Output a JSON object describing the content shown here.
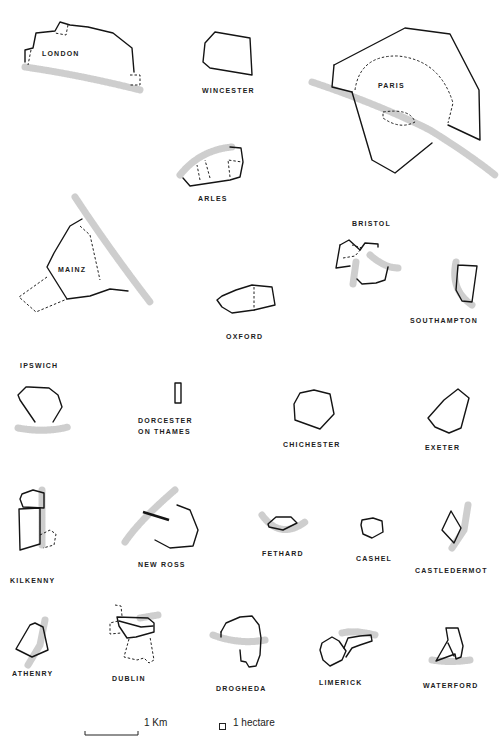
{
  "figure": {
    "towns": [
      {
        "id": "london",
        "name": "LONDON",
        "label_x": 42,
        "label_y": 55,
        "walls": [
          "M25,62 L25,50 L33,48 L36,33 L55,31 L60,22 L70,25 L88,27 L113,33 L132,48 L134,72"
        ],
        "old": [
          "M68,25 L66,35 L55,33",
          "M31,50 L28,65",
          "M130,75 L140,75 L140,85 L130,85"
        ],
        "river": [
          "M25,67 Q80,75 140,90"
        ]
      },
      {
        "id": "wincester",
        "name": "WINCESTER",
        "label_x": 202,
        "label_y": 92,
        "walls": [
          "M215,32 L250,38 L252,75 L210,68 L203,62 L205,43 Z"
        ],
        "old": [],
        "river": []
      },
      {
        "id": "paris",
        "name": "PARIS",
        "label_x": 378,
        "label_y": 87,
        "walls": [
          "M334,65 L405,28 L450,34 L479,90 L480,140 L448,125",
          "M352,92 L372,160 L395,173 L432,143",
          "M334,65 L332,87 L352,92"
        ],
        "old": [
          "M355,90 Q360,55 398,56 Q440,60 453,103 L448,123",
          "M383,112 Q410,108 415,122 Q400,130 383,118 Z"
        ],
        "river": [
          "M312,82 Q380,105 430,130 Q470,155 495,175"
        ]
      },
      {
        "id": "arles",
        "name": "ARLES",
        "label_x": 198,
        "label_y": 200,
        "walls": [
          "M183,178 L190,186 L230,180 L240,177 L243,162 L241,148 L230,147"
        ],
        "old": [
          "M200,180 L197,165",
          "M210,178 L205,160",
          "M230,177 L228,160 L242,162"
        ],
        "river": [
          "M180,175 Q200,150 232,147"
        ]
      },
      {
        "id": "mainz",
        "name": "MAINZ",
        "label_x": 58,
        "label_y": 271,
        "walls": [
          "M82,219 L70,226 L54,253 L47,267 L67,299 L90,296 L110,289 L128,291"
        ],
        "old": [
          "M80,226 L90,235 L100,280",
          "M47,277 L19,297 L36,312 L67,299"
        ],
        "river": [
          "M75,197 Q110,250 150,302"
        ]
      },
      {
        "id": "oxford",
        "name": "OXFORD",
        "label_x": 226,
        "label_y": 338,
        "walls": [
          "M222,296 L236,290 L252,285 L272,287 L275,305 L254,310 L232,313 L222,307 L217,300 Z"
        ],
        "old": [
          "M254,287 L254,311"
        ],
        "river": []
      },
      {
        "id": "bristol",
        "name": "BRISTOL",
        "label_x": 352,
        "label_y": 225,
        "walls": [
          "M340,245 L349,240 L360,250 L365,243 L378,244 L378,247",
          "M340,245 L336,268 L350,266",
          "M357,279 L362,284 L376,283 L385,280 L388,267"
        ],
        "old": [
          "M343,258 L355,256 L362,248 L352,245"
        ],
        "river": [
          "M370,255 Q385,268 398,268",
          "M356,262 L353,284"
        ]
      },
      {
        "id": "southampton",
        "name": "SOUTHAMPTON",
        "label_x": 410,
        "label_y": 322,
        "walls": [
          "M458,265 L477,266 L472,302 L462,301 L456,290 L458,265"
        ],
        "old": [],
        "river": [
          "M456,262 Q450,290 472,305"
        ]
      },
      {
        "id": "ipswich",
        "name": "IPSWICH",
        "label_x": 20,
        "label_y": 367,
        "walls": [
          "M35,422 L20,400 L18,395 L26,387 L29,387 L49,388 L58,395 L62,407 L53,422"
        ],
        "old": [],
        "river": [
          "M18,428 Q45,433 68,427"
        ]
      },
      {
        "id": "dorcester",
        "name": "DORCESTER",
        "name2": "ON THAMES",
        "label_x": 138,
        "label_y": 422,
        "walls": [
          "M175,383 L181,383 L181,403 L175,403 Z"
        ],
        "old": [],
        "river": []
      },
      {
        "id": "chichester",
        "name": "CHICHESTER",
        "label_x": 283,
        "label_y": 446,
        "walls": [
          "M300,393 L314,390 L330,394 L334,414 L320,429 L295,420 L294,404 Z"
        ],
        "old": [],
        "river": []
      },
      {
        "id": "exeter",
        "name": "EXETER",
        "label_x": 425,
        "label_y": 449,
        "walls": [
          "M458,389 L469,398 L461,428 L449,433 L435,427 L428,418 L444,400 Z"
        ],
        "old": [],
        "river": []
      },
      {
        "id": "kilkenny",
        "name": "KILKENNY",
        "label_x": 10,
        "label_y": 582,
        "walls": [
          "M22,494 L33,490 L44,493 L44,508 L23,507 L20,499 Z",
          "M19,509 L40,508 L40,544 L20,550 Z"
        ],
        "old": [
          "M40,535 L50,530 L56,534 L54,545 L43,548"
        ],
        "river": [
          "M42,490 L42,545"
        ]
      },
      {
        "id": "newross",
        "name": "NEW ROSS",
        "label_x": 138,
        "label_y": 566,
        "walls": [
          "M155,540 L170,548 L193,546 L198,530 L190,510 L177,505"
        ],
        "old": [],
        "river": [
          "M175,490 Q140,520 125,542"
        ],
        "bridge": "M143,512 L169,520"
      },
      {
        "id": "fethard",
        "name": "FETHARD",
        "label_x": 262,
        "label_y": 555,
        "walls": [
          "M268,524 L276,517 L291,517 L297,523 L283,530 L269,527 Z"
        ],
        "old": [],
        "river": [
          "M262,515 Q280,540 305,522"
        ]
      },
      {
        "id": "cashel",
        "name": "CASHEL",
        "label_x": 356,
        "label_y": 560,
        "walls": [
          "M362,520 L373,518 L382,521 L383,532 L372,538 L363,534 L361,525 Z"
        ],
        "old": [],
        "river": []
      },
      {
        "id": "castledermot",
        "name": "CASTLEDERMOT",
        "label_x": 415,
        "label_y": 572,
        "walls": [
          "M451,511 L461,528 L454,543 L442,530 Z"
        ],
        "old": [],
        "river": [
          "M468,505 L464,530 L452,548"
        ]
      },
      {
        "id": "athenry",
        "name": "ATHENRY",
        "label_x": 12,
        "label_y": 675,
        "walls": [
          "M30,625 L35,623 L43,627 L48,650 L32,657 L16,649 Z"
        ],
        "old": [],
        "river": [
          "M45,620 L40,645 L28,665"
        ]
      },
      {
        "id": "dublin",
        "name": "DUBLIN",
        "label_x": 112,
        "label_y": 680,
        "walls": [
          "M117,617 L148,618 L154,623 L154,632 L136,637 L127,638 L119,626 Z",
          "M119,621 L141,627 L153,626"
        ],
        "old": [
          "M115,605 L121,606 L122,616",
          "M118,621 L110,623 L110,634 L121,633",
          "M129,639 L124,657 L137,660 L144,658 L149,663 L154,660 L150,637"
        ],
        "river": [
          "M140,618 L158,615"
        ]
      },
      {
        "id": "drogheda",
        "name": "DROGHEDA",
        "label_x": 216,
        "label_y": 690,
        "walls": [
          "M221,632 L226,623 L240,617 L252,616 L259,625 L261,638 L260,655 L256,666 L249,667 L246,662 L241,661 L240,650",
          "M221,632 L221,637"
        ],
        "old": [],
        "river": [
          "M213,635 Q240,645 265,640"
        ]
      },
      {
        "id": "limerick",
        "name": "LIMERICK",
        "label_x": 319,
        "label_y": 684,
        "walls": [
          "M322,643 L332,637 L339,641 L346,651 L342,660 L330,666 L323,660 L320,650 Z",
          "M344,648 L348,638 L360,636 L371,635 L372,641 L360,645 L352,648 L346,657"
        ],
        "old": [],
        "river": [
          "M342,633 Q355,630 375,635"
        ]
      },
      {
        "id": "waterford",
        "name": "WATERFORD",
        "label_x": 423,
        "label_y": 687,
        "walls": [
          "M446,628 L458,628 L463,646 L461,657 L456,659 L455,654 L436,661 L448,640 L446,628",
          "M448,643 L454,656"
        ],
        "old": [],
        "river": [
          "M432,660 Q450,663 470,660"
        ]
      }
    ]
  },
  "legend": {
    "scale_label": "1 Km",
    "area_label": "1 hectare"
  }
}
